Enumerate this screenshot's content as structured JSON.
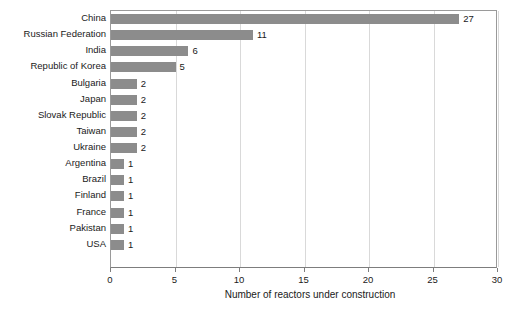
{
  "chart_data": {
    "type": "bar",
    "orientation": "horizontal",
    "title": "",
    "subtitle": "",
    "xlabel": "Number of reactors under construction",
    "ylabel": "",
    "categories": [
      "China",
      "Russian Federation",
      "India",
      "Republic of Korea",
      "Bulgaria",
      "Japan",
      "Slovak Republic",
      "Taiwan",
      "Ukraine",
      "Argentina",
      "Brazil",
      "Finland",
      "France",
      "Pakistan",
      "USA"
    ],
    "values": [
      27,
      11,
      6,
      5,
      2,
      2,
      2,
      2,
      2,
      1,
      1,
      1,
      1,
      1,
      1
    ],
    "data_labels": [
      "27",
      "11",
      "6",
      "5",
      "2",
      "2",
      "2",
      "2",
      "2",
      "1",
      "1",
      "1",
      "1",
      "1",
      "1"
    ],
    "xlim": [
      0,
      30
    ],
    "xticks": [
      0,
      5,
      10,
      15,
      20,
      25,
      30
    ],
    "xtick_labels": [
      "0",
      "5",
      "10",
      "15",
      "20",
      "25",
      "30"
    ],
    "grid": "vertical",
    "legend": "none",
    "bar_color": "#8c8c8c",
    "axis_color": "#7d7d7d",
    "gridline_color": "#d9d9d9",
    "background_color": "#ffffff"
  }
}
